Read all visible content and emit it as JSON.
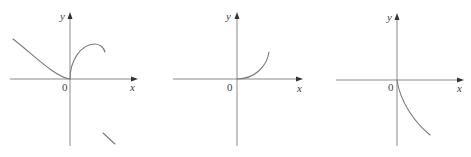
{
  "figure": {
    "panels": [
      {
        "id": "graph-1",
        "y_label": "y",
        "x_label": "x",
        "origin_label": "0",
        "description": "curve decreasing to origin with horizontal tangent on left; rising from origin with vertical tangent to a maximum then turning down on right"
      },
      {
        "id": "graph-2",
        "y_label": "y",
        "x_label": "x",
        "origin_label": "0",
        "description": "curve starting at origin with horizontal tangent, increasing and concave up for x > 0"
      },
      {
        "id": "graph-3",
        "y_label": "y",
        "x_label": "x",
        "origin_label": "0",
        "description": "curve starting at origin with vertical tangent, decreasing for x > 0"
      }
    ],
    "colors": {
      "axis": "#8a8a8a",
      "curve": "#7a7a7a",
      "text": "#444444"
    }
  }
}
